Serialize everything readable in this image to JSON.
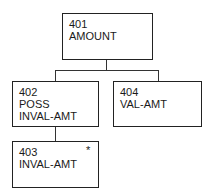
{
  "diagram": {
    "nodes": [
      {
        "id": "401",
        "lines": [
          "401",
          "AMOUNT"
        ]
      },
      {
        "id": "402",
        "lines": [
          "402",
          "POSS",
          "INVAL-AMT"
        ]
      },
      {
        "id": "404",
        "lines": [
          "404",
          "VAL-AMT"
        ]
      },
      {
        "id": "403",
        "lines": [
          "403",
          "INVAL-AMT"
        ],
        "marker": "*"
      }
    ],
    "edges": [
      {
        "from": "401",
        "to": "402"
      },
      {
        "from": "401",
        "to": "404"
      },
      {
        "from": "402",
        "to": "403"
      }
    ]
  }
}
